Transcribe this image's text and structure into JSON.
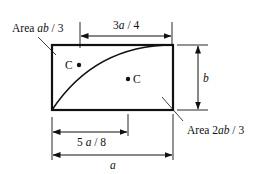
{
  "diagram": {
    "type": "spandrel-area-centroid",
    "rectangle": {
      "width_symbol": "a",
      "height_symbol": "b"
    },
    "labels": {
      "area_upper": {
        "prefix": "Area ",
        "expr_italic": "ab",
        "suffix": " / 3"
      },
      "area_lower": {
        "prefix": "Area 2",
        "expr_italic": "ab",
        "suffix": " / 3"
      },
      "dim_top": {
        "coef": "3",
        "sym": "a",
        "suffix": " / 4"
      },
      "dim_bottom_inner": {
        "coef": "5 ",
        "sym": "a",
        "suffix": " / 8"
      },
      "dim_bottom_outer": "a",
      "dim_right": "b",
      "centroid_upper": "C",
      "centroid_lower": "C"
    },
    "colors": {
      "line": "#111111",
      "background": "#ffffff"
    }
  }
}
